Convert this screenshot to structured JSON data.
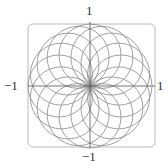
{
  "chart_data": {
    "type": "line",
    "title": "",
    "xlabel": "",
    "ylabel": "",
    "xlim": [
      -1,
      1
    ],
    "ylim": [
      -1,
      1
    ],
    "grid": false,
    "circle_count": 16,
    "tick_labels": {
      "top": "1",
      "bottom": "−1",
      "left": "−1",
      "right": "1"
    },
    "colors": {
      "curve": "#8a8a8a",
      "axis": "#555555",
      "frame": "#bbbbbb"
    }
  }
}
